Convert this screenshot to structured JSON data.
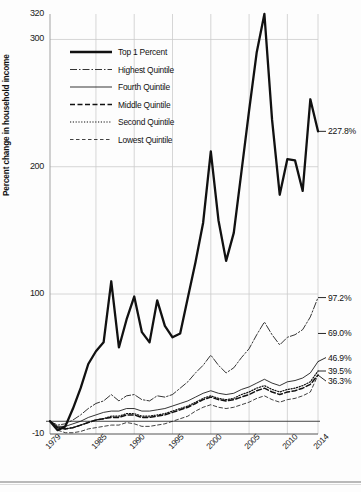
{
  "chart_data": {
    "type": "line",
    "title": "",
    "subtitle": "",
    "xlabel": "",
    "ylabel": "Percent change in household income",
    "xlim": [
      1979,
      2014
    ],
    "ylim": [
      -10,
      320
    ],
    "grid": true,
    "y_ticks": [
      -10,
      100,
      200,
      300,
      320
    ],
    "y_gridlines": [
      100,
      200,
      300
    ],
    "x_ticks": [
      1979,
      1985,
      1990,
      1995,
      2000,
      2005,
      2010,
      2014
    ],
    "x_gridlines": [
      1985,
      1990,
      1995,
      2000,
      2005,
      2010
    ],
    "legend_position": "top-left",
    "x": [
      1979,
      1980,
      1981,
      1982,
      1983,
      1984,
      1985,
      1986,
      1987,
      1988,
      1989,
      1990,
      1991,
      1992,
      1993,
      1994,
      1995,
      1996,
      1997,
      1998,
      1999,
      2000,
      2001,
      2002,
      2003,
      2004,
      2005,
      2006,
      2007,
      2008,
      2009,
      2010,
      2011,
      2012,
      2013,
      2014
    ],
    "series": [
      {
        "name": "Top 1 Percent",
        "style": "thick-solid",
        "end_label": "227.8%",
        "end_value": 227.8,
        "values": [
          0,
          -7,
          -4,
          10,
          26,
          45,
          55,
          62,
          110,
          58,
          80,
          98,
          70,
          62,
          95,
          75,
          66,
          69,
          97,
          125,
          156,
          212,
          158,
          126,
          148,
          196,
          244,
          290,
          320,
          237,
          178,
          206,
          205,
          181,
          253,
          227.8
        ]
      },
      {
        "name": "Highest Quintile",
        "style": "dash-dot",
        "end_label": "97.2%",
        "end_value": 97.2,
        "values": [
          0,
          -3,
          -2,
          1,
          5,
          10,
          14,
          16,
          21,
          16,
          20,
          21,
          17,
          16,
          20,
          19,
          21,
          26,
          31,
          38,
          44,
          52,
          44,
          38,
          42,
          50,
          57,
          68,
          78,
          68,
          60,
          66,
          68,
          72,
          82,
          97.2
        ]
      },
      {
        "name": "Fourth Quintile",
        "style": "thin-solid",
        "end_label": "46.9%",
        "end_value": 46.9,
        "values": [
          0,
          -4,
          -4,
          -2,
          0,
          3,
          5,
          7,
          8,
          8,
          10,
          10,
          8,
          8,
          9,
          10,
          12,
          14,
          16,
          19,
          22,
          24,
          22,
          21,
          22,
          25,
          27,
          30,
          33,
          30,
          28,
          31,
          32,
          34,
          38,
          46.9
        ]
      },
      {
        "name": "Middle Quintile",
        "style": "dashed",
        "end_label": "36.3%",
        "end_value": 36.3,
        "values": [
          0,
          -5,
          -6,
          -5,
          -3,
          -1,
          1,
          2,
          3,
          3,
          5,
          5,
          3,
          3,
          4,
          5,
          7,
          9,
          11,
          14,
          17,
          19,
          17,
          16,
          17,
          19,
          21,
          24,
          26,
          23,
          21,
          23,
          24,
          26,
          29,
          36.3
        ]
      },
      {
        "name": "Second Quintile",
        "style": "dotted",
        "end_label": "39.5%",
        "end_value": 39.5,
        "values": [
          0,
          -5,
          -6,
          -5,
          -3,
          -1,
          1,
          2,
          4,
          4,
          6,
          6,
          4,
          4,
          5,
          6,
          8,
          10,
          12,
          15,
          18,
          20,
          18,
          17,
          18,
          21,
          23,
          26,
          28,
          25,
          23,
          25,
          26,
          28,
          31,
          39.5
        ]
      },
      {
        "name": "Lowest Quintile",
        "style": "fine-dashed",
        "end_label": "",
        "end_value": 36.3,
        "values": [
          0,
          -7,
          -9,
          -9,
          -8,
          -6,
          -5,
          -4,
          -3,
          -3,
          -1,
          -2,
          -4,
          -4,
          -3,
          -2,
          0,
          2,
          4,
          8,
          11,
          13,
          11,
          10,
          11,
          13,
          15,
          18,
          20,
          17,
          15,
          17,
          18,
          20,
          23,
          36.3
        ]
      }
    ],
    "legend": [
      {
        "label": "Top 1 Percent",
        "style": "thick-solid"
      },
      {
        "label": "Highest Quintile",
        "style": "dash-dot"
      },
      {
        "label": "Fourth Quintile",
        "style": "thin-solid"
      },
      {
        "label": "Middle Quintile",
        "style": "dashed"
      },
      {
        "label": "Second Quintile",
        "style": "dotted"
      },
      {
        "label": "Lowest Quintile",
        "style": "fine-dashed"
      }
    ],
    "end_labels": [
      {
        "text": "227.8%",
        "value": 227.8
      },
      {
        "text": "97.2%",
        "value": 97.2
      },
      {
        "text": "69.0%",
        "value": 69.0
      },
      {
        "text": "46.9%",
        "value": 46.9
      },
      {
        "text": "39.5%",
        "value": 39.5
      },
      {
        "text": "36.3%",
        "value": 36.3
      }
    ],
    "colors": {
      "line": "#111111",
      "grid": "#cccccc",
      "axis": "#555555",
      "background": "#ffffff"
    }
  }
}
